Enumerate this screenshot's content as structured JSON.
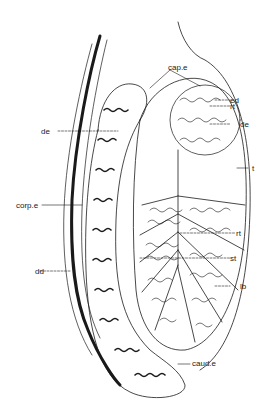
{
  "diagram": {
    "labels": {
      "cap_e": "cap.e",
      "ed": "ed",
      "rt_top": "rt",
      "de_right": "de",
      "t": "t",
      "de_left": "de",
      "corp_e": "corp.e",
      "rt_mid": "rt",
      "st": "st",
      "dd": "dd",
      "lb": "lb",
      "caud_e": "caud.e"
    },
    "colors": {
      "line": "#1a1a1a",
      "background": "#ffffff"
    }
  }
}
